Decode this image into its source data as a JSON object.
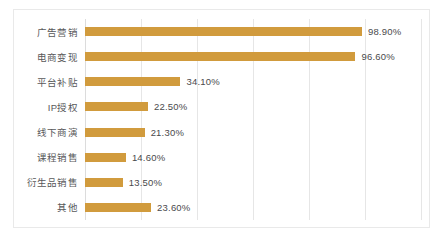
{
  "chart_data": {
    "type": "bar",
    "orientation": "horizontal",
    "title": "",
    "subtitle": "",
    "xlabel": "",
    "ylabel": "",
    "xlim": [
      0,
      120
    ],
    "grid": true,
    "grid_axis": "x",
    "legend": false,
    "value_label_format": "percent-2dp",
    "bar_color": "#d19b3d",
    "gridline_color": "#e6e6e6",
    "axis_color": "#dcdcdc",
    "card_border_color": "#e9e9e9",
    "background_color": "#ffffff",
    "label_color": "#58585a",
    "value_color": "#4a4a4c",
    "gridline_values": [
      20,
      40,
      60,
      80,
      100,
      120
    ],
    "categories": [
      "广告营销",
      "电商变现",
      "平台补贴",
      "IP授权",
      "线下商演",
      "课程销售",
      "衍生品销售",
      "其他"
    ],
    "values": [
      98.9,
      96.6,
      34.1,
      22.5,
      21.3,
      14.6,
      13.5,
      23.6
    ],
    "value_labels": [
      "98.90%",
      "96.60%",
      "34.10%",
      "22.50%",
      "21.30%",
      "14.60%",
      "13.50%",
      "23.60%"
    ]
  }
}
